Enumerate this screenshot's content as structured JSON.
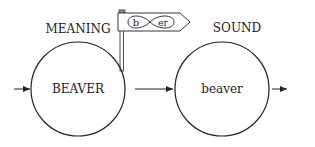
{
  "labels": {
    "meaning": "MEANING",
    "sound": "SOUND"
  },
  "nodes": {
    "meaning_node": "BEAVER",
    "sound_node": "beaver"
  },
  "flag": {
    "left_glyph": "b",
    "right_glyph": "er"
  },
  "colors": {
    "stroke": "#222222",
    "background": "#ffffff"
  }
}
